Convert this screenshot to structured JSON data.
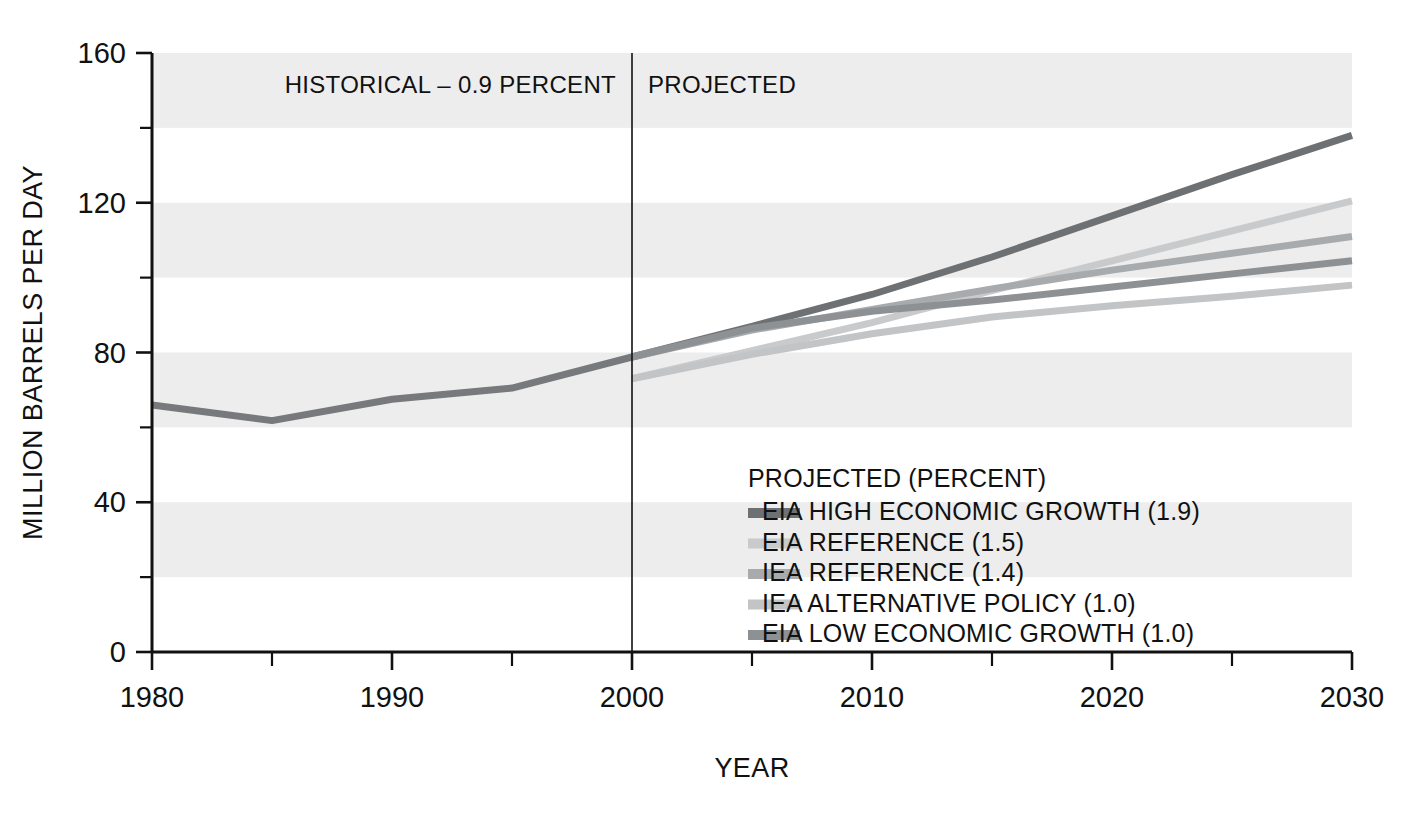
{
  "chart_data": {
    "type": "line",
    "title": "",
    "xlabel": "YEAR",
    "ylabel": "MILLION BARRELS PER DAY",
    "xlim": [
      1980,
      2030
    ],
    "ylim": [
      0,
      160
    ],
    "yticks": [
      0,
      40,
      80,
      120,
      160
    ],
    "ytick_labels": [
      "0",
      "40",
      "80",
      "120",
      "160"
    ],
    "xticks": [
      1980,
      1985,
      1990,
      1995,
      2000,
      2005,
      2010,
      2015,
      2020,
      2025,
      2030
    ],
    "xtick_labels": [
      "1980",
      "",
      "1990",
      "",
      "2000",
      "",
      "2010",
      "",
      "2020",
      "",
      "2030"
    ],
    "xtick_major": [
      "1980",
      "1990",
      "2000",
      "2010",
      "2020",
      "2030"
    ],
    "grid": "horizontal-bands",
    "band_interval": 20,
    "legend_position": "inside-lower-right",
    "annotations": [
      {
        "name": "historical",
        "text": "HISTORICAL – 0.9 PERCENT",
        "x": 2000,
        "align": "right"
      },
      {
        "name": "projected",
        "text": "PROJECTED",
        "x": 2000,
        "align": "left"
      },
      {
        "name": "divider",
        "text": "",
        "x": 2000,
        "type": "vertical-line"
      }
    ],
    "series": [
      {
        "name": "HISTORICAL",
        "label": "HISTORICAL – 0.9 PERCENT",
        "color": "#77797c",
        "width": 7,
        "in_legend": false,
        "x": [
          1980,
          1985,
          1990,
          1995,
          2000
        ],
        "values": [
          66.0,
          61.8,
          67.5,
          70.5,
          78.8
        ]
      },
      {
        "name": "EIA HIGH ECONOMIC GROWTH",
        "label": "EIA HIGH ECONOMIC GROWTH (1.9)",
        "percent": 1.9,
        "color": "#6e7174",
        "width": 7,
        "in_legend": true,
        "x": [
          2000,
          2005,
          2010,
          2015,
          2020,
          2025,
          2030
        ],
        "values": [
          78.8,
          87.0,
          95.5,
          105.5,
          116.5,
          127.5,
          138.0
        ]
      },
      {
        "name": "EIA REFERENCE",
        "label": "EIA REFERENCE (1.5)",
        "percent": 1.5,
        "color": "#c8cacc",
        "width": 7,
        "in_legend": true,
        "x": [
          2000,
          2005,
          2010,
          2015,
          2020,
          2025,
          2030
        ],
        "values": [
          73.0,
          80.5,
          88.0,
          96.5,
          104.5,
          112.5,
          120.5
        ]
      },
      {
        "name": "IEA REFERENCE",
        "label": "IEA REFERENCE (1.4)",
        "percent": 1.4,
        "color": "#a8abad",
        "width": 7,
        "in_legend": true,
        "x": [
          2000,
          2005,
          2010,
          2015,
          2020,
          2025,
          2030
        ],
        "values": [
          78.8,
          86.0,
          91.5,
          97.0,
          102.0,
          106.5,
          111.0
        ]
      },
      {
        "name": "IEA ALTERNATIVE POLICY",
        "label": "IEA ALTERNATIVE POLICY (1.0)",
        "percent": 1.0,
        "color": "#c2c4c6",
        "width": 7,
        "in_legend": true,
        "x": [
          2000,
          2005,
          2010,
          2015,
          2020,
          2025,
          2030
        ],
        "values": [
          73.0,
          79.5,
          85.0,
          89.5,
          92.5,
          95.0,
          98.0
        ]
      },
      {
        "name": "EIA LOW ECONOMIC GROWTH",
        "label": "EIA LOW ECONOMIC GROWTH (1.0)",
        "percent": 1.0,
        "color": "#8e9194",
        "width": 7,
        "in_legend": true,
        "x": [
          2000,
          2005,
          2010,
          2015,
          2020,
          2025,
          2030
        ],
        "values": [
          78.8,
          86.5,
          91.0,
          94.0,
          97.5,
          101.0,
          104.5
        ]
      }
    ]
  },
  "legend": {
    "title": "PROJECTED (PERCENT)",
    "items": [
      {
        "label": "EIA HIGH ECONOMIC GROWTH (1.9)",
        "color": "#6e7174"
      },
      {
        "label": "EIA REFERENCE (1.5)",
        "color": "#c8cacc"
      },
      {
        "label": "IEA REFERENCE (1.4)",
        "color": "#a8abad"
      },
      {
        "label": "IEA ALTERNATIVE POLICY (1.0)",
        "color": "#c2c4c6"
      },
      {
        "label": "EIA LOW ECONOMIC GROWTH (1.0)",
        "color": "#8e9194"
      }
    ]
  },
  "colors": {
    "background": "#ffffff",
    "band": "#ededed",
    "axis": "#111111",
    "text": "#111111"
  }
}
